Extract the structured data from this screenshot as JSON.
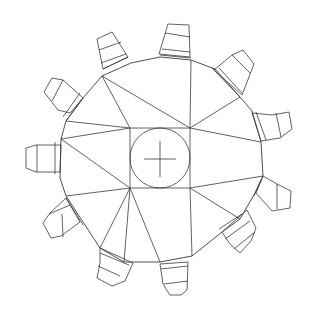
{
  "diagram": {
    "type": "gear-line-drawing",
    "tooth_count": 10,
    "stroke_color": "#3a3a3a",
    "background_color": "#ffffff",
    "center": [
      160,
      158
    ],
    "center_circle_radius": 30,
    "center_square": [
      130,
      128,
      190,
      188
    ],
    "hub_vertices": [
      [
        102,
        76
      ],
      [
        191,
        60
      ],
      [
        240,
        97
      ],
      [
        261,
        142
      ],
      [
        263,
        176
      ],
      [
        240,
        219
      ],
      [
        192,
        256
      ],
      [
        124,
        262
      ],
      [
        66,
        196
      ],
      [
        61,
        139
      ]
    ]
  }
}
